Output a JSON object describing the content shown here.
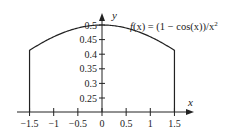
{
  "chart_data": {
    "type": "line",
    "title": "",
    "annotation": "f(x) = (1 − cos(x))/x²",
    "xlabel": "x",
    "ylabel": "y",
    "xlim": [
      -1.5,
      1.5
    ],
    "ylim": [
      0.2,
      0.5
    ],
    "x_ticks": [
      "−1.5",
      "−1",
      "−0.5",
      "0",
      "0.5",
      "1",
      "1.5"
    ],
    "y_ticks": [
      "0.25",
      "0.3",
      "0.35",
      "0.4",
      "0.45",
      "0.5"
    ],
    "grid": false,
    "legend": "none",
    "series": [
      {
        "name": "f(x) = (1 − cos(x))/x²",
        "x": [
          -1.5,
          -1.25,
          -1.0,
          -0.75,
          -0.5,
          -0.25,
          0,
          0.25,
          0.5,
          0.75,
          1.0,
          1.25,
          1.5
        ],
        "values": [
          0.413,
          0.439,
          0.46,
          0.477,
          0.49,
          0.497,
          0.5,
          0.497,
          0.49,
          0.477,
          0.46,
          0.439,
          0.413
        ]
      }
    ]
  },
  "labels": {
    "x_axis": "x",
    "y_axis": "y",
    "formula_f": "f",
    "formula_rest": "(x) = (1 − cos(x))/x",
    "formula_sup": "2"
  }
}
